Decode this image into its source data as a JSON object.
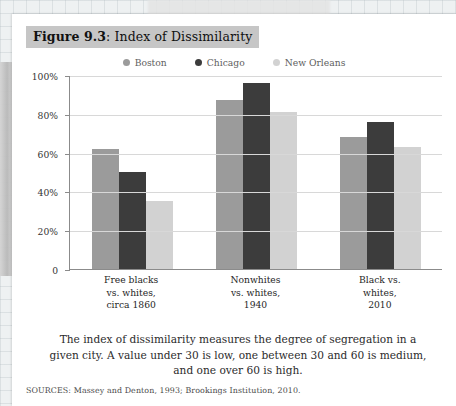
{
  "figure": {
    "number_label": "Figure 9.3",
    "title_separator": ": ",
    "title": "Index of Dissimilarity"
  },
  "legend": {
    "position": "top-center",
    "items": [
      {
        "label": "Boston",
        "color": "#9b9b9b",
        "marker": "legend-dot-icon"
      },
      {
        "label": "Chicago",
        "color": "#3c3c3c",
        "marker": "legend-dot-icon"
      },
      {
        "label": "New Orleans",
        "color": "#d2d2d2",
        "marker": "legend-dot-icon"
      }
    ]
  },
  "caption": {
    "line1": "The index of dissimilarity measures the degree of segregation in a",
    "line2": "given city. A value under 30 is low, one between 30 and 60 is medium,",
    "line3": "and one over 60 is high."
  },
  "sources": "SOURCES: Massey and Denton, 1993; Brookings Institution, 2010.",
  "axis": {
    "y_ticks": [
      {
        "label": "100%",
        "value": 100
      },
      {
        "label": "80%",
        "value": 80
      },
      {
        "label": "60%",
        "value": 60
      },
      {
        "label": "40%",
        "value": 40
      },
      {
        "label": "20%",
        "value": 20
      },
      {
        "label": "0",
        "value": 0
      }
    ]
  },
  "chart_data": {
    "type": "bar",
    "title": "Index of Dissimilarity",
    "xlabel": "",
    "ylabel": "",
    "ylim": [
      0,
      100
    ],
    "grid": true,
    "legend_position": "top-center",
    "categories": [
      "Free blacks\nvs. whites,\ncirca 1860",
      "Nonwhites\nvs. whites,\n1940",
      "Black vs.\nwhites,\n2010"
    ],
    "category_lines": [
      [
        "Free blacks",
        "vs. whites,",
        "circa 1860"
      ],
      [
        "Nonwhites",
        "vs. whites,",
        "1940"
      ],
      [
        "Black vs.",
        "whites,",
        "2010"
      ]
    ],
    "series": [
      {
        "name": "Boston",
        "color": "#9b9b9b",
        "values": [
          62,
          87,
          68
        ]
      },
      {
        "name": "Chicago",
        "color": "#3c3c3c",
        "values": [
          50,
          96,
          76
        ]
      },
      {
        "name": "New Orleans",
        "color": "#d2d2d2",
        "values": [
          35,
          81,
          63
        ]
      }
    ],
    "y_tick_labels": [
      "0",
      "20%",
      "40%",
      "60%",
      "80%",
      "100%"
    ],
    "y_tick_values": [
      0,
      20,
      40,
      60,
      80,
      100
    ]
  }
}
